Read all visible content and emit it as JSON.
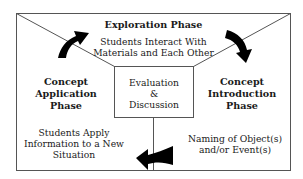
{
  "diagram": {
    "type": "learning-cycle",
    "colors": {
      "line": "#555555",
      "arrow": "#000000",
      "text": "#1a1a1a"
    },
    "top": {
      "title": "Exploration Phase",
      "description_line1": "Students Interact With",
      "description_line2": "Materials and Each Other"
    },
    "left": {
      "title_line1": "Concept",
      "title_line2": "Application",
      "title_line3": "Phase",
      "description_line1": "Students Apply",
      "description_line2": "Information to a New",
      "description_line3": "Situation"
    },
    "right": {
      "title_line1": "Concept",
      "title_line2": "Introduction",
      "title_line3": "Phase",
      "description_line1": "Naming of Object(s)",
      "description_line2": "and/or Event(s)"
    },
    "center": {
      "line1": "Evaluation",
      "line2": "&",
      "line3": "Discussion"
    },
    "arrows": [
      {
        "name": "arrow-application-to-exploration",
        "direction": "up-right"
      },
      {
        "name": "arrow-exploration-to-introduction",
        "direction": "down-right"
      },
      {
        "name": "arrow-introduction-to-application",
        "direction": "left"
      }
    ]
  }
}
